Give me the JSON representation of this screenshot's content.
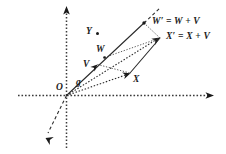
{
  "figure": {
    "kind": "vector-addition-diagram",
    "background_color": "#ffffff",
    "ink_color": "#1a1a1a",
    "width": 226,
    "height": 154
  },
  "axes": {
    "origin_label": "O",
    "horizontal": {
      "name": "horizontal-axis",
      "style": "dotted",
      "arrow": "right"
    },
    "vertical": {
      "name": "vertical-axis",
      "style": "dotted",
      "arrow": "up"
    }
  },
  "labels": {
    "origin": "O",
    "g": "g",
    "v": "V",
    "w": "W",
    "x": "X",
    "y": "Y",
    "w_prime": "W′ = W + V",
    "x_prime": "X′ = X + V"
  },
  "points": {
    "O": {
      "label": "O",
      "x": 66.5,
      "y": 95.5
    },
    "V": {
      "label": "V",
      "x": 97.0,
      "y": 65.0
    },
    "W": {
      "label": "W",
      "x": 104.0,
      "y": 57.0
    },
    "X": {
      "label": "X",
      "x": 130.0,
      "y": 73.0
    },
    "Y": {
      "label": "Y",
      "x": 90.0,
      "y": 31.0
    },
    "Wp": {
      "label": "W′",
      "x": 144.0,
      "y": 23.0
    },
    "Xp": {
      "label": "X′",
      "x": 160.0,
      "y": 38.0
    }
  },
  "segments": [
    {
      "name": "geodesic-g",
      "from": "O",
      "to": "Wp",
      "style": "solid"
    },
    {
      "name": "geodesic-extension",
      "from": "Wp",
      "to": "ext",
      "style": "dashed"
    },
    {
      "name": "vector-X",
      "from": "O",
      "to": "X",
      "style": "dotted"
    },
    {
      "name": "vector-X-prime",
      "from": "O",
      "to": "Xp",
      "style": "dotted"
    },
    {
      "name": "segment-X-to-Xp",
      "from": "X",
      "to": "Xp",
      "style": "solid"
    },
    {
      "name": "segment-V-to-X",
      "from": "V",
      "to": "X",
      "style": "thin-dotted"
    },
    {
      "name": "segment-W-to-Xp",
      "from": "W",
      "to": "Xp",
      "style": "thin-dotted"
    },
    {
      "name": "segment-Wp-to-Xp",
      "from": "Wp",
      "to": "Xp",
      "style": "thin-dotted"
    },
    {
      "name": "lower-left-ray",
      "from": "O",
      "to": "dl",
      "style": "dashed"
    }
  ],
  "markers": {
    "Y_dot": true,
    "V_arrowhead": true,
    "X_arrowhead": true,
    "Xp_arrowhead": true,
    "Wp_dot": true,
    "axis_arrowheads": [
      "right",
      "up"
    ],
    "lower_left_arrowhead": true
  }
}
